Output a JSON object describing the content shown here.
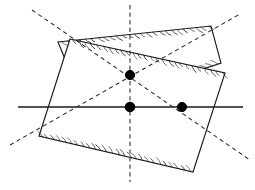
{
  "figure": {
    "title": "",
    "background_color": "#ffffff",
    "width": 255,
    "height": 190,
    "line_color": "#1a1a1a",
    "hatch_color": "#3a3a3a",
    "node_color": "#000000"
  },
  "chart_data": {
    "type": "diagram",
    "title": "",
    "xlabel": "",
    "ylabel": "",
    "grid": false,
    "legend": null,
    "bands": [
      {
        "name": "band-descending",
        "orientation": "upper-left-to-lower-right",
        "centerline_angle_deg": 36,
        "corners": [
          [
            58,
            42
          ],
          [
            211,
            26
          ],
          [
            221,
            63
          ],
          [
            85,
            108
          ]
        ],
        "centerline": [
          [
            32,
            10
          ],
          [
            250,
            160
          ]
        ],
        "hatched": true
      },
      {
        "name": "band-ascending",
        "orientation": "lower-left-to-upper-right",
        "centerline_angle_deg": -36,
        "corners": [
          [
            70,
            39
          ],
          [
            225,
            73
          ],
          [
            193,
            172
          ],
          [
            39,
            136
          ]
        ],
        "centerline": [
          [
            10,
            145
          ],
          [
            240,
            14
          ]
        ],
        "hatched": true
      }
    ],
    "axes_lines": [
      {
        "name": "horizontal-axis",
        "style": "solid",
        "points": [
          [
            18,
            107
          ],
          [
            243,
            107
          ]
        ]
      },
      {
        "name": "vertical-centerline",
        "style": "dashed",
        "points": [
          [
            130,
            5
          ],
          [
            130,
            182
          ]
        ]
      },
      {
        "name": "descending-centerline",
        "style": "dashed",
        "points": [
          [
            32,
            10
          ],
          [
            250,
            160
          ]
        ]
      },
      {
        "name": "ascending-centerline",
        "style": "dashed",
        "points": [
          [
            10,
            145
          ],
          [
            240,
            14
          ]
        ]
      }
    ],
    "nodes": [
      {
        "name": "node-upper",
        "x": 130,
        "y": 75,
        "radius": 4.6
      },
      {
        "name": "node-center",
        "x": 130,
        "y": 107,
        "radius": 4.8
      },
      {
        "name": "node-right",
        "x": 182,
        "y": 107,
        "radius": 4.6
      }
    ]
  }
}
